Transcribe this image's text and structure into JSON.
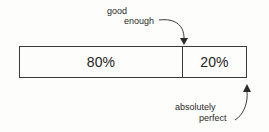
{
  "diagram": {
    "top_annotation": {
      "line1": "good",
      "line2": "enough"
    },
    "bottom_annotation": {
      "line1": "absolutely",
      "line2": "perfect"
    },
    "segments": [
      {
        "label": "80%",
        "value": 80
      },
      {
        "label": "20%",
        "value": 20
      }
    ],
    "colors": {
      "stroke": "#3a3a3a",
      "text": "#2a2a2a",
      "background": "#fdfdfb"
    }
  }
}
